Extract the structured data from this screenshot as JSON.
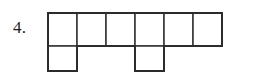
{
  "page": {
    "background_color": "#ffffff",
    "width": 268,
    "height": 81
  },
  "item": {
    "number_label": "4.",
    "label_color": "#1d1d1d"
  },
  "figure": {
    "name": "hexomino-grid-figure",
    "cell_size": 34,
    "columns": 6,
    "rows": 2,
    "stroke_color": "#3a3a3a",
    "outline_color": "#2b2b2b",
    "fill_color": "#ffffff",
    "origin_x": 2,
    "origin_y": 2,
    "filled_cells": [
      {
        "row": 0,
        "col": 0
      },
      {
        "row": 0,
        "col": 1
      },
      {
        "row": 0,
        "col": 2
      },
      {
        "row": 0,
        "col": 3
      },
      {
        "row": 0,
        "col": 4
      },
      {
        "row": 0,
        "col": 5
      },
      {
        "row": 1,
        "col": 0
      },
      {
        "row": 1,
        "col": 3
      }
    ],
    "top_row_cells": 6,
    "bottom_row_cells": 2,
    "total_squares": 8
  }
}
